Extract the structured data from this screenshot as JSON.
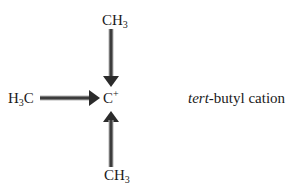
{
  "diagram": {
    "title": "tert-butyl cation",
    "center": {
      "element": "C",
      "charge": "+"
    },
    "substituents": [
      {
        "position": "top",
        "main": "CH",
        "subscript": "3",
        "arrow_direction": "toward-center"
      },
      {
        "position": "left",
        "prefix": "H",
        "subscript": "3",
        "suffix": "C",
        "arrow_direction": "toward-center"
      },
      {
        "position": "bottom",
        "main": "CH",
        "subscript": "3",
        "arrow_direction": "toward-center"
      }
    ],
    "caption": {
      "italic_part": "tert",
      "rest": "-butyl cation"
    },
    "colors": {
      "arrow": "#2b2b2b",
      "arrow_highlight": "#9a9a9a",
      "text": "#1a1a1a"
    }
  }
}
